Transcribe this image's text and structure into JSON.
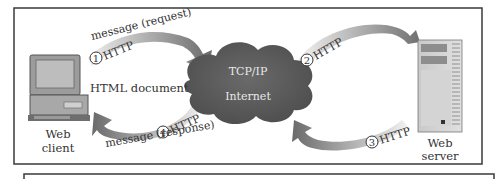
{
  "diagram": {
    "nodes": {
      "client": {
        "label_line1": "Web",
        "label_line2": "client"
      },
      "server": {
        "label_line1": "Web",
        "label_line2": "server"
      },
      "cloud": {
        "label_line1": "TCP/IP",
        "label_line2": "Internet"
      }
    },
    "arrows": [
      {
        "step": "1",
        "protocol": "HTTP",
        "caption": "message (request)",
        "from": "client",
        "to": "internet"
      },
      {
        "step": "2",
        "protocol": "HTTP",
        "caption": "",
        "from": "internet",
        "to": "server"
      },
      {
        "step": "3",
        "protocol": "HTTP",
        "caption": "",
        "from": "server",
        "to": "internet"
      },
      {
        "step": "4",
        "protocol": "HTTP",
        "caption": "message (response)",
        "from": "internet",
        "to": "client"
      }
    ],
    "document_label": "HTML document",
    "colors": {
      "arrow_dark": "#6e6e6e",
      "arrow_light": "#e6e6e6",
      "cloud": "#5c5c5c",
      "cloud_text": "#e8e8e8",
      "frame": "#3a3a3a"
    }
  }
}
